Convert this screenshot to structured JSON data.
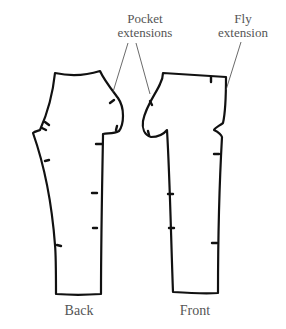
{
  "diagram": {
    "type": "sewing-pattern",
    "pieces": [
      {
        "id": "back",
        "label": "Back"
      },
      {
        "id": "front",
        "label": "Front"
      }
    ],
    "callouts": [
      {
        "id": "pocket-extensions",
        "line1": "Pocket",
        "line2": "extensions",
        "targets": [
          "back",
          "front"
        ]
      },
      {
        "id": "fly-extension",
        "line1": "Fly",
        "line2": "extension",
        "targets": [
          "front"
        ]
      }
    ],
    "colors": {
      "outline": "#111111",
      "label_text": "#555555",
      "leader": "#444444",
      "background": "#ffffff"
    }
  }
}
